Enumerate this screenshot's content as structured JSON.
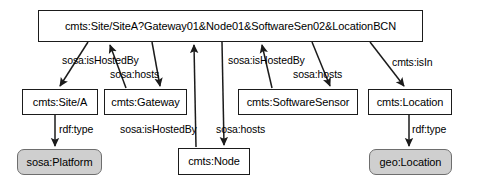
{
  "diagram": {
    "type": "rdf-graph",
    "background_color": "#ffffff",
    "stroke_color": "#1b1b1b",
    "class_node_fill": "#cfcfcf",
    "instance_node_fill": "#ffffff",
    "nodes": [
      {
        "id": "root",
        "label": "cmts:Site/SiteA?Gateway01&Node01&SoftwareSen02&LocationBCN",
        "kind": "instance",
        "x": 38,
        "y": 10,
        "w": 385,
        "h": 32
      },
      {
        "id": "site",
        "label": "cmts:Site/A",
        "kind": "instance",
        "x": 22,
        "y": 89,
        "w": 76,
        "h": 26
      },
      {
        "id": "gateway",
        "label": "cmts:Gateway",
        "kind": "instance",
        "x": 104,
        "y": 89,
        "w": 83,
        "h": 26
      },
      {
        "id": "softwaresensor",
        "label": "cmts:SoftwareSensor",
        "kind": "instance",
        "x": 238,
        "y": 89,
        "w": 120,
        "h": 26
      },
      {
        "id": "location",
        "label": "cmts:Location",
        "kind": "instance",
        "x": 368,
        "y": 89,
        "w": 84,
        "h": 26
      },
      {
        "id": "node",
        "label": "cmts:Node",
        "kind": "instance",
        "x": 178,
        "y": 148,
        "w": 72,
        "h": 27
      },
      {
        "id": "sosaplatform",
        "label": "sosa:Platform",
        "kind": "class",
        "x": 17,
        "y": 149,
        "w": 85,
        "h": 26
      },
      {
        "id": "geolocation",
        "label": "geo:Location",
        "kind": "class",
        "x": 369,
        "y": 149,
        "w": 83,
        "h": 26
      }
    ],
    "edges": [
      {
        "from": "root",
        "to": "site",
        "label": "sosa:hosts",
        "label_shown": false
      },
      {
        "from": "gateway",
        "to": "root",
        "label": "sosa:isHostedBy",
        "label_shown": true,
        "label_x": 62,
        "label_y": 55
      },
      {
        "from": "root",
        "to": "gateway",
        "label": "sosa:hosts",
        "label_shown": true,
        "label_x": 110,
        "label_y": 69
      },
      {
        "from": "node",
        "to": "root",
        "label": "sosa:isHostedBy",
        "label_shown": true,
        "label_x": 120,
        "label_y": 124
      },
      {
        "from": "root",
        "to": "node",
        "label": "sosa:hosts",
        "label_shown": true,
        "label_x": 216,
        "label_y": 124
      },
      {
        "from": "softwaresensor",
        "to": "root",
        "label": "sosa:isHostedBy",
        "label_shown": true,
        "label_x": 228,
        "label_y": 55
      },
      {
        "from": "root",
        "to": "softwaresensor",
        "label": "sosa:hosts",
        "label_shown": true,
        "label_x": 293,
        "label_y": 69
      },
      {
        "from": "root",
        "to": "location",
        "label": "cmts:isIn",
        "label_shown": true,
        "label_x": 392,
        "label_y": 57
      },
      {
        "from": "site",
        "to": "sosaplatform",
        "label": "rdf:type",
        "label_shown": true,
        "label_x": 59,
        "label_y": 124
      },
      {
        "from": "location",
        "to": "geolocation",
        "label": "rdf:type",
        "label_shown": true,
        "label_x": 412,
        "label_y": 124
      }
    ]
  }
}
